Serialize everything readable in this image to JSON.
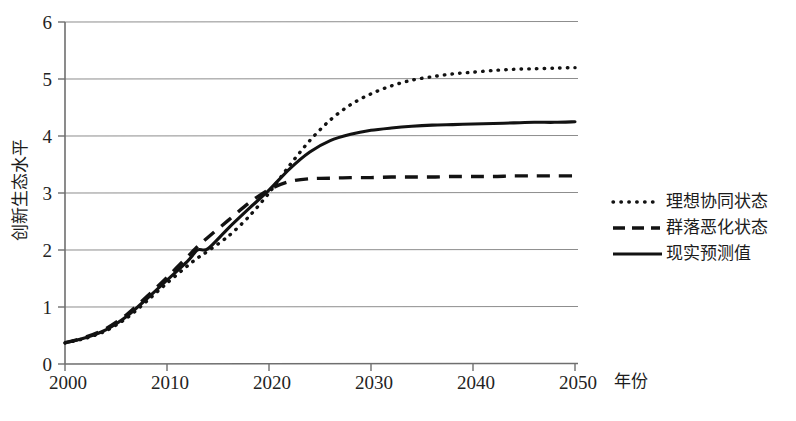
{
  "chart_data": {
    "type": "line",
    "title": "",
    "xlabel": "年份",
    "ylabel": "创新生态水平",
    "xlim": [
      2000,
      2050
    ],
    "ylim": [
      0,
      6
    ],
    "grid": true,
    "legend_position": "right",
    "x_ticks": [
      "2000",
      "2010",
      "2020",
      "2030",
      "2040",
      "2050"
    ],
    "x_tick_values": [
      2000,
      2010,
      2020,
      2030,
      2040,
      2050
    ],
    "y_ticks": [
      "0",
      "1",
      "2",
      "3",
      "4",
      "5",
      "6"
    ],
    "y_tick_values": [
      0,
      1,
      2,
      3,
      4,
      5,
      6
    ],
    "x": [
      2000,
      2002,
      2004,
      2006,
      2008,
      2010,
      2012,
      2013,
      2014,
      2016,
      2018,
      2020,
      2022,
      2024,
      2026,
      2028,
      2030,
      2032,
      2034,
      2036,
      2038,
      2040,
      2042,
      2044,
      2046,
      2048,
      2050
    ],
    "series": [
      {
        "name": "理想协同状态",
        "style": "dotted",
        "color": "#121212",
        "values": [
          0.37,
          0.45,
          0.58,
          0.8,
          1.1,
          1.42,
          1.72,
          1.86,
          1.98,
          2.24,
          2.58,
          3.0,
          3.48,
          3.92,
          4.28,
          4.55,
          4.74,
          4.88,
          4.98,
          5.04,
          5.09,
          5.12,
          5.15,
          5.17,
          5.18,
          5.19,
          5.2
        ]
      },
      {
        "name": "群落恶化状态",
        "style": "dashed",
        "color": "#121212",
        "values": [
          0.37,
          0.47,
          0.62,
          0.86,
          1.18,
          1.52,
          1.88,
          2.06,
          2.22,
          2.52,
          2.82,
          3.06,
          3.2,
          3.25,
          3.26,
          3.27,
          3.27,
          3.28,
          3.28,
          3.28,
          3.29,
          3.29,
          3.29,
          3.3,
          3.3,
          3.3,
          3.3
        ]
      },
      {
        "name": "现实预测值",
        "style": "solid",
        "color": "#121212",
        "values": [
          0.37,
          0.46,
          0.6,
          0.83,
          1.14,
          1.47,
          1.8,
          2.0,
          2.02,
          2.38,
          2.72,
          3.05,
          3.42,
          3.72,
          3.92,
          4.03,
          4.1,
          4.14,
          4.17,
          4.19,
          4.2,
          4.21,
          4.22,
          4.23,
          4.24,
          4.24,
          4.25
        ]
      }
    ],
    "legend_entries": [
      {
        "label": "理想协同状态",
        "style": "dotted"
      },
      {
        "label": "群落恶化状态",
        "style": "dashed"
      },
      {
        "label": "现实预测值",
        "style": "solid"
      }
    ]
  }
}
